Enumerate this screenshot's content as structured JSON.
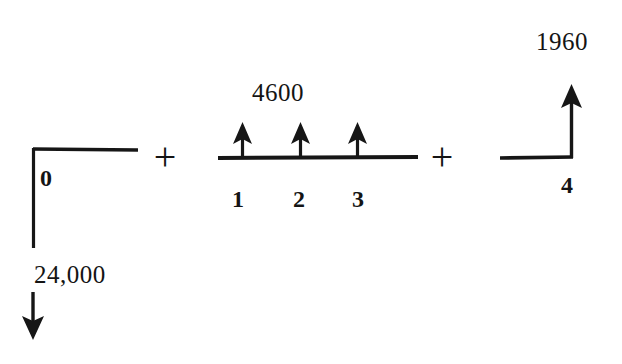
{
  "diagram": {
    "background_color": "#ffffff",
    "ink_color": "#161616",
    "operators": [
      {
        "id": "plus-1",
        "symbol": "+",
        "x": 165,
        "y": 157
      },
      {
        "id": "plus-2",
        "symbol": "+",
        "x": 442,
        "y": 157
      }
    ],
    "components": [
      {
        "id": "outflow-initial",
        "name": "initial-investment",
        "direction": "down",
        "amount_label": "24,000",
        "period_labels": [
          "0"
        ],
        "baseline": {
          "x1": 33,
          "x2": 137,
          "y": 149
        },
        "arrow": {
          "x": 33,
          "from_y": 149,
          "to_y": 338
        },
        "amount_label_pos": {
          "x": 34,
          "y": 282
        },
        "period_label_pos": {
          "x": 40,
          "y": 184
        }
      },
      {
        "id": "inflow-uniform-series",
        "name": "uniform-annual-series",
        "direction": "up",
        "amount_label": "4600",
        "period_labels": [
          "1",
          "2",
          "3"
        ],
        "baseline": {
          "x1": 218,
          "x2": 418,
          "y": 157
        },
        "arrows": [
          {
            "x": 242,
            "from_y": 157,
            "to_y": 124
          },
          {
            "x": 300,
            "from_y": 157,
            "to_y": 124
          },
          {
            "x": 357,
            "from_y": 157,
            "to_y": 124
          }
        ],
        "amount_label_pos": {
          "x": 252,
          "y": 100
        },
        "period_label_positions": [
          {
            "x": 238,
            "y": 205
          },
          {
            "x": 298,
            "y": 205
          },
          {
            "x": 357,
            "y": 205
          }
        ]
      },
      {
        "id": "inflow-salvage",
        "name": "salvage-value",
        "direction": "up",
        "amount_label": "1960",
        "period_labels": [
          "4"
        ],
        "baseline": {
          "x1": 500,
          "x2": 573,
          "y": 157
        },
        "arrow": {
          "x": 572,
          "from_y": 157,
          "to_y": 85
        },
        "amount_label_pos": {
          "x": 536,
          "y": 49
        },
        "period_label_pos": {
          "x": 566,
          "y": 191
        }
      }
    ]
  }
}
